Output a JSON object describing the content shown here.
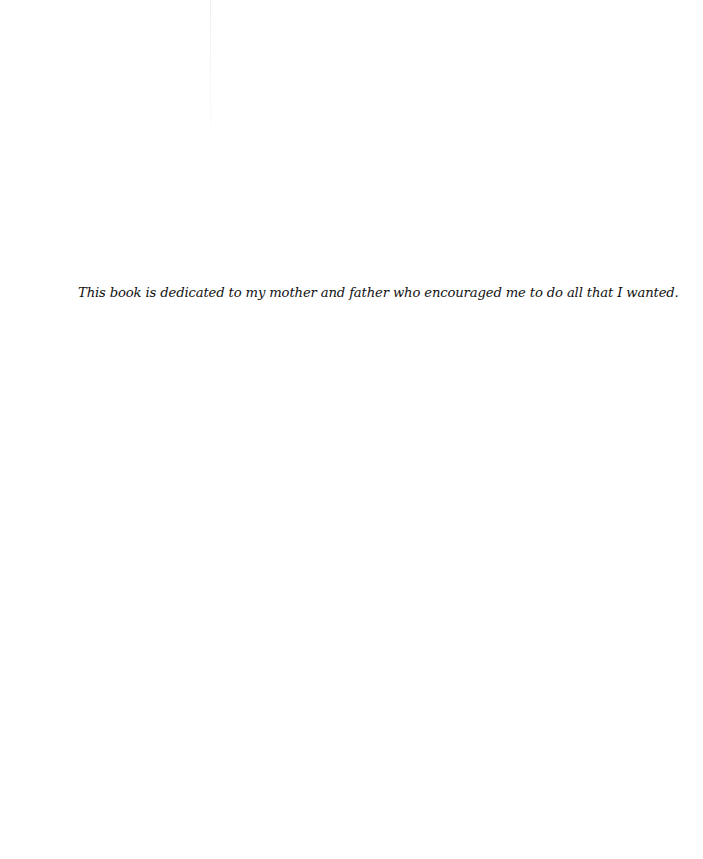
{
  "page": {
    "type": "dedication",
    "text": "This book is dedicated to my mother and father who encouraged me to do all that I wanted."
  },
  "colors": {
    "background": "#ffffff",
    "text": "#111111"
  }
}
